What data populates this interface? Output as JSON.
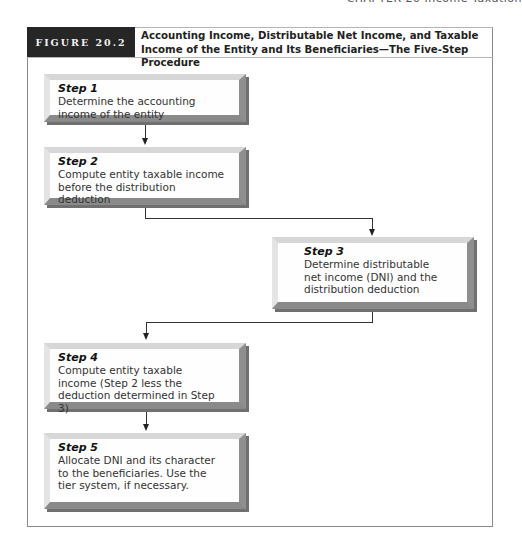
{
  "running_head": "CHAPTER 20  Income Taxation",
  "figure": {
    "label": "FIGURE 20.2",
    "title": "Accounting Income, Distributable Net Income, and Taxable Income of the Entity and Its Beneficiaries—The Five-Step Procedure"
  },
  "steps": [
    {
      "title": "Step 1",
      "text": "Determine the accounting income of the entity"
    },
    {
      "title": "Step 2",
      "text": "Compute entity taxable income before the distribution deduction"
    },
    {
      "title": "Step 3",
      "text": "Determine distributable net income (DNI) and the distribution deduction"
    },
    {
      "title": "Step 4",
      "text": "Compute entity taxable income (Step 2 less the deduction determined in Step 3)"
    },
    {
      "title": "Step 5",
      "text": "Allocate DNI and its character to the beneficiaries. Use the tier system, if necessary."
    }
  ],
  "colors": {
    "label_background": "#262626",
    "box_face": "#fefefe",
    "bevel_light": "#d7d7d7",
    "bevel_dark": "#8a8a8a"
  }
}
